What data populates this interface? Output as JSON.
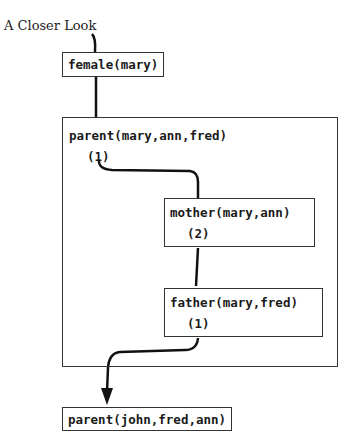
{
  "title": "A Closer Look",
  "nodes": {
    "female": {
      "label": "female(mary)"
    },
    "parent_outer": {
      "label": "parent(mary,ann,fred)",
      "counter": "(1)"
    },
    "mother": {
      "label": "mother(mary,ann)",
      "counter": "(2)"
    },
    "father": {
      "label": "father(mary,fred)",
      "counter": "(1)"
    },
    "parent_next": {
      "label": "parent(john,fred,ann)"
    }
  },
  "colors": {
    "line": "#111111",
    "border": "#333333",
    "background": "#ffffff"
  }
}
